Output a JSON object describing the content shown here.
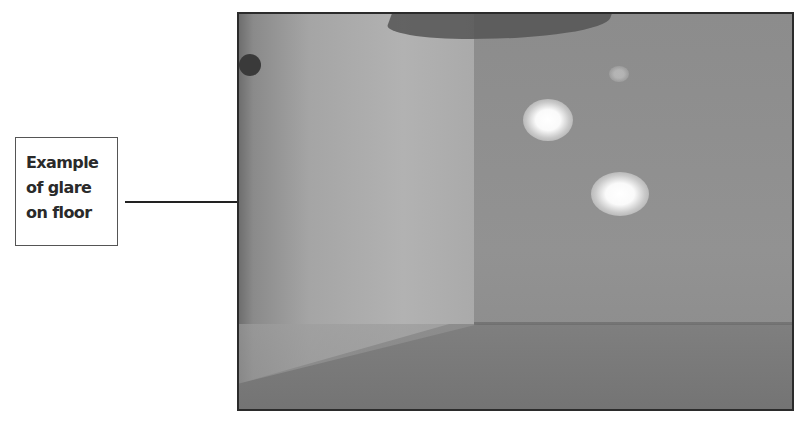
{
  "annotation": {
    "label": "Example\nof glare\non floor",
    "arrow_target": "glare-spot-lower"
  },
  "photo": {
    "description": "Grayscale photo of room corner with two bright glare spots on floor",
    "glare_spots": 2
  },
  "colors": {
    "frame": "#2b2b2b",
    "arrow": "#222222",
    "label_border": "#555555",
    "label_text": "#2a2a2a"
  }
}
